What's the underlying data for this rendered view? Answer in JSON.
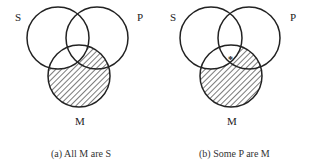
{
  "panels": [
    {
      "id": "a",
      "labels": {
        "s": "S",
        "p": "P",
        "m": "M"
      },
      "caption": "(a) All M are S",
      "shaded_region": "M outside S",
      "marker": ""
    },
    {
      "id": "b",
      "labels": {
        "s": "S",
        "p": "P",
        "m": "M"
      },
      "caption": "(b) Some P are M",
      "shaded_region": "M outside S",
      "marker": "*"
    }
  ],
  "colors": {
    "stroke": "#222222",
    "hatch": "#333333",
    "background": "#ffffff"
  }
}
